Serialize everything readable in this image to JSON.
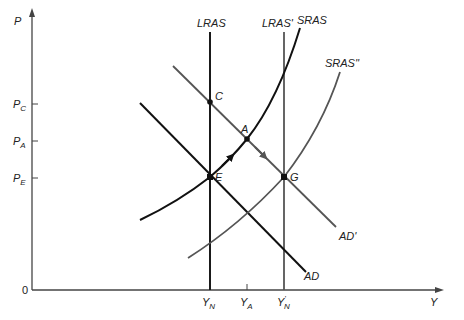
{
  "diagram": {
    "type": "aggregate-demand-aggregate-supply",
    "axes": {
      "y_label": "P",
      "x_label": "Y",
      "origin_label": "0",
      "y_ticks": [
        {
          "main": "P",
          "sub": "C",
          "level": "C"
        },
        {
          "main": "P",
          "sub": "A",
          "level": "A"
        },
        {
          "main": "P",
          "sub": "E",
          "level": "E"
        }
      ],
      "x_ticks": [
        {
          "main": "Y",
          "sub": "N",
          "prime": ""
        },
        {
          "main": "Y",
          "sub": "A",
          "prime": ""
        },
        {
          "main": "Y",
          "sub": "N",
          "prime": "'"
        }
      ]
    },
    "curves": {
      "lras": {
        "label": "LRAS",
        "color": "#1a1a1a"
      },
      "lras_prime": {
        "label": "LRAS'",
        "color": "#555555"
      },
      "sras": {
        "label": "SRAS",
        "color": "#111111"
      },
      "sras_double_prime": {
        "label": "SRAS''",
        "color": "#555555"
      },
      "ad": {
        "label": "AD",
        "color": "#111111"
      },
      "ad_prime": {
        "label": "AD'",
        "color": "#555555"
      }
    },
    "points": {
      "C": "C",
      "A": "A",
      "E": "E",
      "G": "G"
    },
    "colors": {
      "dark": "#111111",
      "gray": "#555555",
      "axis": "#444444",
      "background": "#ffffff"
    }
  }
}
